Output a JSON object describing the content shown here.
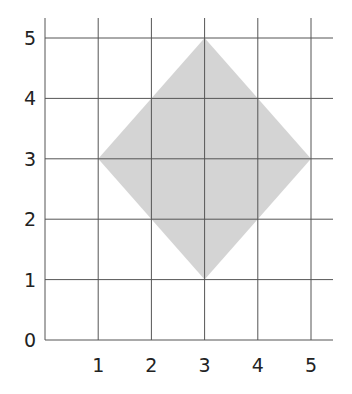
{
  "chart_data": {
    "type": "area",
    "title": "",
    "xlabel": "",
    "ylabel": "",
    "xlim": [
      0,
      5
    ],
    "ylim": [
      0,
      5
    ],
    "grid": true,
    "x_ticks": [
      "1",
      "2",
      "3",
      "4",
      "5"
    ],
    "y_ticks": [
      "0",
      "1",
      "2",
      "3",
      "4",
      "5"
    ],
    "shape": {
      "name": "square (rotated 45°)",
      "vertices": [
        [
          3,
          5
        ],
        [
          5,
          3
        ],
        [
          3,
          1
        ],
        [
          1,
          3
        ]
      ],
      "fill": "#d4d4d4"
    }
  },
  "colors": {
    "grid": "#555555",
    "fill": "#d4d4d4",
    "text": "#222222"
  }
}
